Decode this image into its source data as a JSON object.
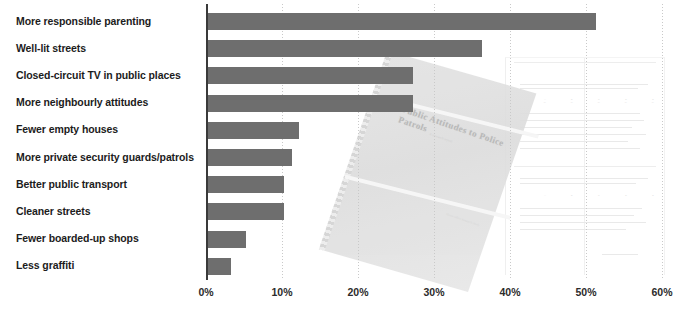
{
  "chart_data": {
    "type": "bar",
    "orientation": "horizontal",
    "title": "",
    "xlabel": "",
    "ylabel": "",
    "xlim": [
      0,
      60
    ],
    "grid": true,
    "legend": false,
    "bar_color": "#6e6e6e",
    "categories": [
      "More responsible parenting",
      "Well-lit streets",
      "Closed-circuit TV in public places",
      "More neighbourly attitudes",
      "Fewer empty houses",
      "More private security guards/patrols",
      "Better public transport",
      "Cleaner streets",
      "Fewer boarded-up shops",
      "Less graffiti"
    ],
    "values": [
      51,
      36,
      27,
      27,
      12,
      11,
      10,
      10,
      5,
      3
    ],
    "value_unit": "%",
    "xticks": [
      0,
      10,
      20,
      30,
      40,
      50,
      60
    ],
    "xtick_labels": [
      "0%",
      "10%",
      "20%",
      "30%",
      "40%",
      "50%",
      "60%"
    ]
  },
  "overlay": {
    "cover_title": "Public Attitudes to Police Patrols",
    "cover_subtitle": "A research report",
    "cover_footer": "Home Office Research Study"
  }
}
